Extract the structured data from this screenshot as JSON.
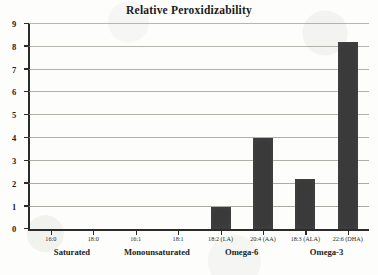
{
  "chart_data": {
    "type": "bar",
    "title": "Relative Peroxidizability",
    "xlabel": "",
    "ylabel": "",
    "ylim": [
      0,
      9
    ],
    "yticks": [
      0,
      1,
      2,
      3,
      4,
      5,
      6,
      7,
      8,
      9
    ],
    "grid": true,
    "legend": "none",
    "bar_color": "#3a3a3a",
    "categories": [
      "16:0",
      "18:0",
      "16:1",
      "18:1",
      "18:2 (LA)",
      "20:4 (AA)",
      "18:3 (ALA)",
      "22:6 (DHA)"
    ],
    "values": [
      0,
      0,
      0,
      0,
      1,
      4,
      2.2,
      8.2
    ],
    "groups": [
      {
        "label": "Saturated",
        "members": [
          "16:0",
          "18:0"
        ]
      },
      {
        "label": "Monounsaturated",
        "members": [
          "16:1",
          "18:1"
        ]
      },
      {
        "label": "Omega-6",
        "members": [
          "18:2 (LA)",
          "20:4 (AA)"
        ]
      },
      {
        "label": "Omega-3",
        "members": [
          "18:3 (ALA)",
          "22:6 (DHA)"
        ]
      }
    ]
  }
}
